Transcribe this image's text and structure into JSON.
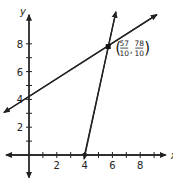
{
  "chart_data": {
    "type": "line",
    "title": "",
    "xlabel": "x",
    "ylabel": "y",
    "xlim": [
      -1.8,
      9.7
    ],
    "ylim": [
      -1.5,
      9.8
    ],
    "xticks": [
      2,
      4,
      6,
      8
    ],
    "yticks": [
      2,
      4,
      6,
      8
    ],
    "minor_tick_step": 1,
    "grid": false,
    "series": [
      {
        "name": "line-shallow",
        "points": [
          [
            -1.8,
            3.06
          ],
          [
            9.2,
            10.1
          ]
        ],
        "slope": 0.63,
        "intercept": 4.2
      },
      {
        "name": "line-steep",
        "points": [
          [
            4,
            0
          ],
          [
            6.25,
            10.3
          ]
        ],
        "slope": 4.59,
        "x_intercept": 4
      }
    ],
    "annotations": [
      {
        "type": "point",
        "x": 5.7,
        "y": 7.8,
        "label_num_x": "57",
        "label_den_x": "10",
        "label_num_y": "78",
        "label_den_y": "10"
      }
    ]
  }
}
